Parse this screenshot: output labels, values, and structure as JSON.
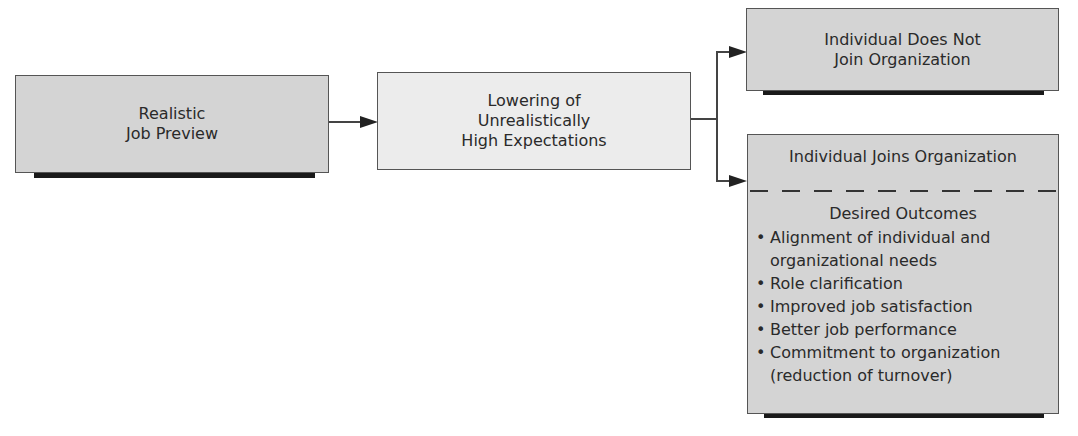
{
  "diagram": {
    "nodes": {
      "realistic_job_preview": {
        "lines": [
          "Realistic",
          "Job Preview"
        ]
      },
      "lowering_expectations": {
        "lines": [
          "Lowering of",
          "Unrealistically",
          "High Expectations"
        ]
      },
      "does_not_join": {
        "lines": [
          "Individual Does Not",
          "Join Organization"
        ]
      },
      "joins": {
        "title": "Individual Joins Organization",
        "outcomes_title": "Desired Outcomes",
        "outcomes": [
          "Alignment of individual and organizational needs",
          "Role clarification",
          "Improved job satisfaction",
          "Better job performance",
          "Commitment to organization (reduction of turnover)"
        ]
      }
    },
    "edges": [
      {
        "from": "realistic_job_preview",
        "to": "lowering_expectations"
      },
      {
        "from": "lowering_expectations",
        "to": "does_not_join"
      },
      {
        "from": "lowering_expectations",
        "to": "joins"
      }
    ],
    "colors": {
      "dark_fill": "#d4d4d4",
      "light_fill": "#ececec",
      "shadow": "#1a1a1a",
      "line": "#444444"
    }
  }
}
